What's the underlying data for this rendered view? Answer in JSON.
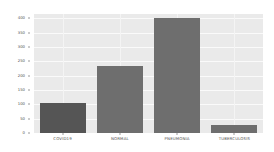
{
  "chart_data": {
    "type": "bar",
    "title": "",
    "xlabel": "",
    "ylabel": "",
    "categories": [
      "COVID19",
      "NORMAL",
      "PNEUMONIA",
      "TUBERCULOSIS"
    ],
    "values": [
      105,
      235,
      400,
      27
    ],
    "ylim": [
      0,
      415
    ],
    "yticks": [
      0,
      50,
      100,
      150,
      200,
      250,
      300,
      350,
      400
    ],
    "ytick_labels": [
      "0",
      "50",
      "100",
      "150",
      "200",
      "250",
      "300",
      "350",
      "400"
    ],
    "grid": true,
    "legend": null,
    "colors": {
      "bar_default": "#6e6e6e",
      "bar_first": "#555555",
      "axes_background": "#eaeaea",
      "gridline": "#fafafa",
      "figure_background": "#ffffff",
      "tick_text": "#4f4f4f"
    }
  }
}
